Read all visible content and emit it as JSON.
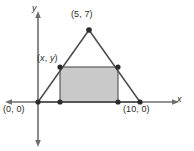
{
  "figure": {
    "kind": "coordinate-plane-diagram",
    "background_color": "#ffffff",
    "line_color": "#4a4a4a",
    "axis_color": "#6e6e6e",
    "point_color": "#2b2b2b",
    "shade_fill_color": "#c9c9c9",
    "shade_stroke_color": "#5a5a5a",
    "text_color": "#2b2b2b"
  },
  "axes": {
    "x_label": "x",
    "y_label": "y",
    "x_axis_arrows": "both",
    "y_axis_arrows": "both",
    "gridlines": false,
    "tick_labels": []
  },
  "labels": {
    "apex": "(5, 7)",
    "rect_corner": "(x, y)",
    "origin": "(0, 0)",
    "base_right": "(10, 0)"
  },
  "chart_data": {
    "type": "scatter",
    "title": "",
    "xlabel": "x",
    "ylabel": "y",
    "xlim": [
      -3,
      15
    ],
    "ylim": [
      -4.5,
      11
    ],
    "grid": false,
    "legend": "none",
    "shapes": [
      {
        "name": "triangle",
        "type": "polygon",
        "filled": false,
        "points": [
          [
            0,
            0
          ],
          [
            10,
            0
          ],
          [
            5,
            7
          ]
        ]
      },
      {
        "name": "inscribed-rectangle",
        "type": "polygon",
        "filled": true,
        "fill": "#c9c9c9",
        "points": [
          [
            2.15,
            0
          ],
          [
            2.15,
            3.4
          ],
          [
            7.85,
            3.4
          ],
          [
            7.85,
            0
          ]
        ]
      }
    ],
    "points": [
      {
        "label": "(0, 0)",
        "x": 0,
        "y": 0,
        "label_position": "below-left"
      },
      {
        "label": "(10, 0)",
        "x": 10,
        "y": 0,
        "label_position": "below-right"
      },
      {
        "label": "(5, 7)",
        "x": 5,
        "y": 7,
        "label_position": "above"
      },
      {
        "label": "(x, y)",
        "x": 2.15,
        "y": 3.4,
        "label_position": "above-left"
      },
      {
        "label": "",
        "x": 7.85,
        "y": 3.4,
        "label_position": "none"
      },
      {
        "label": "",
        "x": 2.15,
        "y": 0,
        "label_position": "none"
      },
      {
        "label": "",
        "x": 7.85,
        "y": 0,
        "label_position": "none"
      }
    ],
    "annotations": [
      {
        "text": "(5, 7)",
        "x": 5,
        "y": 7
      },
      {
        "text": "(x, y)",
        "x": 2.15,
        "y": 3.4
      },
      {
        "text": "(0, 0)",
        "x": 0,
        "y": 0
      },
      {
        "text": "(10, 0)",
        "x": 10,
        "y": 0
      }
    ]
  }
}
